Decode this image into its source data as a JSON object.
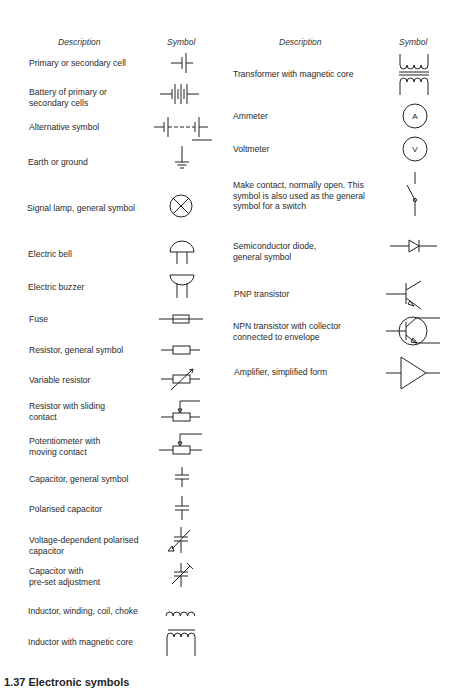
{
  "left_column": {
    "header_description": "Description",
    "header_symbol": "Symbol",
    "rows": [
      {
        "label": "Primary or secondary cell",
        "symbol": "cell-icon"
      },
      {
        "label": "Battery of primary or\nsecondary cells",
        "symbol": "battery-icon"
      },
      {
        "label": "Alternative symbol",
        "symbol": "battery-alt-icon"
      },
      {
        "label": "Earth or ground",
        "symbol": "ground-icon"
      },
      {
        "label": "Signal lamp, general symbol",
        "symbol": "lamp-icon"
      },
      {
        "label": "Electric bell",
        "symbol": "bell-icon"
      },
      {
        "label": "Electric buzzer",
        "symbol": "buzzer-icon"
      },
      {
        "label": "Fuse",
        "symbol": "fuse-icon"
      },
      {
        "label": "Resistor, general symbol",
        "symbol": "resistor-icon"
      },
      {
        "label": "Variable resistor",
        "symbol": "variable-resistor-icon"
      },
      {
        "label": "Resistor with sliding\ncontact",
        "symbol": "sliding-resistor-icon"
      },
      {
        "label": "Potentiometer with\nmoving contact",
        "symbol": "potentiometer-icon"
      },
      {
        "label": "Capacitor, general symbol",
        "symbol": "capacitor-icon"
      },
      {
        "label": "Polarised capacitor",
        "symbol": "polarised-capacitor-icon"
      },
      {
        "label": "Voltage-dependent polarised\ncapacitor",
        "symbol": "voltage-capacitor-icon"
      },
      {
        "label": "Capacitor with\npre-set adjustment",
        "symbol": "preset-capacitor-icon"
      },
      {
        "label": "Inductor, winding, coil, choke",
        "symbol": "inductor-icon"
      },
      {
        "label": "Inductor with magnetic core",
        "symbol": "inductor-core-icon"
      }
    ]
  },
  "right_column": {
    "header_description": "Description",
    "header_symbol": "Symbol",
    "rows": [
      {
        "label": "Transformer with magnetic core",
        "symbol": "transformer-icon"
      },
      {
        "label": "Ammeter",
        "symbol": "ammeter-icon",
        "glyph": "A"
      },
      {
        "label": "Voltmeter",
        "symbol": "voltmeter-icon",
        "glyph": "V"
      },
      {
        "label": "Make contact, normally open. This\nsymbol is also used as the general\nsymbol for a switch",
        "symbol": "switch-icon"
      },
      {
        "label": "Semiconductor diode,\ngeneral symbol",
        "symbol": "diode-icon"
      },
      {
        "label": "PNP transistor",
        "symbol": "pnp-transistor-icon"
      },
      {
        "label": "NPN transistor with collector\nconnected to envelope",
        "symbol": "npn-transistor-icon"
      },
      {
        "label": "Amplifier, simplified form",
        "symbol": "amplifier-icon"
      }
    ]
  },
  "caption": "1.37 Electronic symbols"
}
